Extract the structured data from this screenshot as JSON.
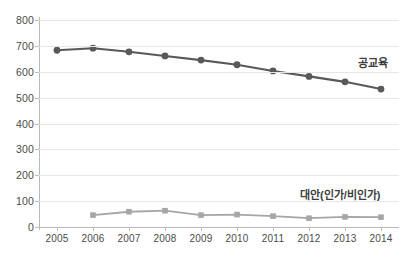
{
  "chart_data": {
    "type": "line",
    "title": "",
    "xlabel": "",
    "ylabel": "",
    "categories": [
      "2005",
      "2006",
      "2007",
      "2008",
      "2009",
      "2010",
      "2011",
      "2012",
      "2013",
      "2014"
    ],
    "ylim": [
      0,
      800
    ],
    "yticks": [
      0,
      100,
      200,
      300,
      400,
      500,
      600,
      700,
      800
    ],
    "ytick_labels": [
      "0",
      "100",
      "200",
      "300",
      "400",
      "500",
      "600",
      "700",
      "800"
    ],
    "grid": true,
    "legend": "inline-annotation",
    "series": [
      {
        "name": "공교육",
        "color": "#595959",
        "marker": "circle",
        "values": [
          683,
          691,
          677,
          661,
          645,
          627,
          603,
          582,
          561,
          533
        ]
      },
      {
        "name": "대안(인가/비인가)",
        "color": "#a6a6a6",
        "marker": "square",
        "values": [
          null,
          46,
          59,
          63,
          46,
          48,
          42,
          34,
          39,
          38
        ]
      }
    ],
    "annotations": [
      {
        "id": "public",
        "text": "공교육"
      },
      {
        "id": "alt",
        "text": "대안(인가/비인가)"
      }
    ]
  },
  "colors": {
    "series_public": "#595959",
    "series_alt": "#a6a6a6",
    "grid": "#e6e6e6",
    "axis": "#b8b8b8",
    "text": "#4a4a4a",
    "background": "#ffffff"
  }
}
